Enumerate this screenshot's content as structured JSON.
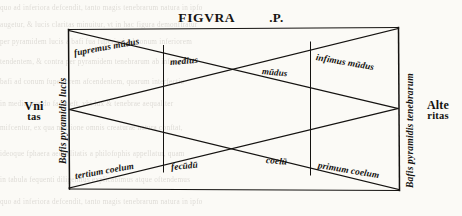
{
  "page": {
    "width": 462,
    "height": 216,
    "background_color": "#fbfaf6",
    "ink_color": "#14120f"
  },
  "title": {
    "main": "FIGVRA",
    "suffix": ".P."
  },
  "diagram": {
    "kind": "two-interpenetrating-pyramids",
    "frame": {
      "top_left": [
        68,
        28
      ],
      "top_right": [
        398,
        28
      ],
      "bottom_right": [
        398,
        190
      ],
      "bottom_left": [
        68,
        190
      ]
    },
    "divider_x": [
      163,
      310
    ],
    "crossing_upper": [
      238,
      72
    ],
    "crossing_lower": [
      240,
      153
    ]
  },
  "labels": {
    "left_base": "Bafis pyramidis lucis",
    "right_base": "Bafis pyramidis tenebrarum",
    "left_outer_line1": "Vni",
    "left_outer_line2": "tas",
    "right_outer_line1": "Alte",
    "right_outer_line2": "ritas",
    "upper_band": [
      "fupremus mūdus",
      "medius",
      "mūdus",
      "infimus mūdus"
    ],
    "lower_band": [
      "tertium coelum",
      "fecūdū",
      "coelū",
      "primum coelum"
    ]
  },
  "ghost_text": {
    "note": "faint show-through of printed text from the facing/backing page",
    "lines": [
      "quo ad inferiora defcendit, tanto magis tenebrarum natura in ipfo",
      "augetur, & lucis claritas minuitur, vt in hac figura demonftratur",
      "per pyramidem lucis a bafi fua fuperiori ad conum inferiorem",
      "tendentem, & contra per pyramidem tenebrarum ab inferiori",
      "bafi ad conum fuperiorem afcendentem, quarum interfectio",
      "in medio mundo facta eft, vbi lux & tenebrae aequaliter",
      "mifcentur, ex qua mixtione omnis creaturae natura conftat,",
      "ideoque fphaera aequalitatis a philofophis appellatur, quam",
      "in tabula fequenti diligentius explicabimus atque oftendemus"
    ]
  }
}
